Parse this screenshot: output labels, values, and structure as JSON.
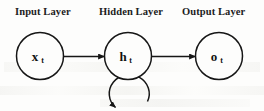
{
  "figure": {
    "background_color": "#fdfdfc",
    "stroke_color": "#161616",
    "text_color": "#1c1c1c"
  },
  "layers": [
    {
      "id": "input",
      "label": "Input Layer",
      "node_symbol": "x",
      "node_subscript": "t",
      "cx": 40,
      "cy": 56,
      "r": 23
    },
    {
      "id": "hidden",
      "label": "Hidden Layer",
      "node_symbol": "h",
      "node_subscript": "t",
      "cx": 128,
      "cy": 56,
      "r": 23
    },
    {
      "id": "output",
      "label": "Output Layer",
      "node_symbol": "o",
      "node_subscript": "t",
      "cx": 219,
      "cy": 56,
      "r": 23
    }
  ],
  "connections": [
    {
      "id": "input-to-hidden",
      "from": "input",
      "to": "hidden",
      "kind": "arrow"
    },
    {
      "id": "hidden-to-output",
      "from": "hidden",
      "to": "output",
      "kind": "arrow"
    },
    {
      "id": "hidden-self-loop",
      "from": "hidden",
      "to": "hidden",
      "kind": "recurrent-loop"
    }
  ]
}
